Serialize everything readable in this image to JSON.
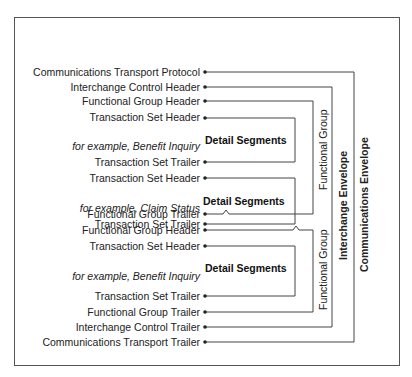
{
  "diagram": {
    "rows": [
      {
        "id": "comm-transport-protocol",
        "label": "Communications Transport Protocol",
        "y": 72
      },
      {
        "id": "interchange-control-header",
        "label": "Interchange Control Header",
        "y": 87
      },
      {
        "id": "functional-group-header-1",
        "label": "Functional Group Header",
        "y": 101
      },
      {
        "id": "transaction-set-header-1",
        "label": "Transaction Set Header",
        "y": 117
      },
      {
        "id": "example-1",
        "label": "for example, Benefit Inquiry",
        "y": 147,
        "italic": true
      },
      {
        "id": "transaction-set-trailer-1",
        "label": "Transaction Set Trailer",
        "y": 162
      },
      {
        "id": "transaction-set-header-2",
        "label": "Transaction Set Header",
        "y": 178
      },
      {
        "id": "example-2",
        "label": "for example, Claim Status",
        "y": 208,
        "italic": true
      },
      {
        "id": "transaction-set-trailer-2",
        "label": "Transaction Set Trailer",
        "y": 224
      },
      {
        "id": "functional-group-trailer-1",
        "label": "Functional Group Trailer",
        "y": 240
      },
      {
        "id": "functional-group-header-2",
        "label": "Functional Group Header",
        "y": 255
      },
      {
        "id": "transaction-set-header-3",
        "label": "Transaction Set Header",
        "y": 271
      },
      {
        "id": "example-3",
        "label": "for example, Benefit Inquiry",
        "y": 300,
        "italic": true
      },
      {
        "id": "transaction-set-trailer-3",
        "label": "Transaction Set Trailer",
        "y": 316
      },
      {
        "id": "functional-group-trailer-2",
        "label": "Functional Group Trailer",
        "y": 332
      },
      {
        "id": "interchange-control-trailer",
        "label": "Interchange Control Trailer",
        "y": 347
      },
      {
        "id": "comm-transport-trailer",
        "label": "Communications Transport Trailer",
        "y": 362
      }
    ],
    "detail_segments": "Detail Segments",
    "functional_group": "Functional Group",
    "interchange_envelope": "Interchange Envelope",
    "communications_envelope": "Communications Envelope"
  }
}
